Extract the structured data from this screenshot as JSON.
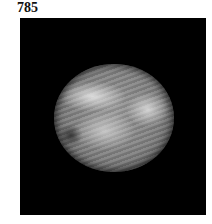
{
  "figure": {
    "label": "785",
    "image_description": "grayscale circular microscopy/endoscopic field of view on black background showing fibrous tissue strands"
  }
}
